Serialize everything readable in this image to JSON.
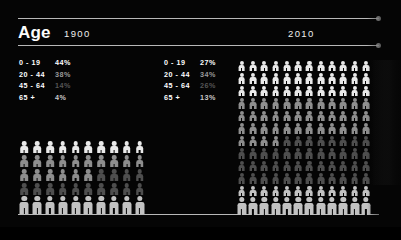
{
  "title": "Age",
  "columns": [
    {
      "era": "1900"
    },
    {
      "era": "2010"
    }
  ],
  "legend_1900": [
    {
      "range": "0 - 19",
      "pct": "44%"
    },
    {
      "range": "20 - 44",
      "pct": "38%"
    },
    {
      "range": "45 - 64",
      "pct": "14%"
    },
    {
      "range": "65 +",
      "pct": "4%"
    }
  ],
  "legend_2010": [
    {
      "range": "0 - 19",
      "pct": "27%"
    },
    {
      "range": "20 - 44",
      "pct": "34%"
    },
    {
      "range": "45 - 64",
      "pct": "26%"
    },
    {
      "range": "65 +",
      "pct": "13%"
    }
  ],
  "chart_data": {
    "type": "bar",
    "title": "Age",
    "xlabel": "",
    "ylabel": "",
    "categories": [
      "0 - 19",
      "20 - 44",
      "45 - 64",
      "65 +"
    ],
    "series": [
      {
        "name": "1900",
        "values": [
          44,
          38,
          14,
          4
        ]
      },
      {
        "name": "2010",
        "values": [
          27,
          34,
          26,
          13
        ]
      }
    ],
    "unit": "percent",
    "ylim": [
      0,
      100
    ],
    "grid": false,
    "legend": "inline-left"
  },
  "pictograms": {
    "g1900": {
      "cols": 10,
      "rows": 5,
      "band_counts": [
        10,
        16,
        14,
        10
      ]
    },
    "g2010": {
      "cols": 12,
      "rows": 12,
      "band_counts": [
        36,
        40,
        44,
        24
      ]
    }
  },
  "colors": {
    "background": "#050505",
    "rule": "#d8d8d8",
    "band0": "#e9e9e9",
    "band1": "#8e8e8e",
    "band2": "#4e4e4e",
    "band3": "#c2c2c2"
  }
}
